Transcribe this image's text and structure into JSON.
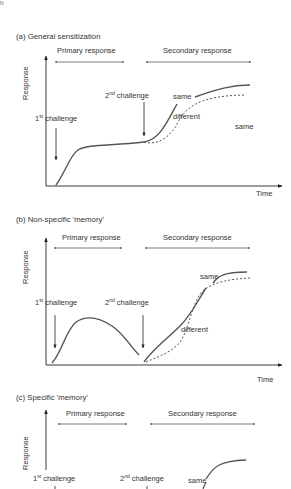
{
  "corner_mark": "N",
  "panels": [
    {
      "title": "(a) General sensitization",
      "primary_label": "Primary response",
      "secondary_label": "Secondary response",
      "y_axis": "Response",
      "x_axis": "Time",
      "first_challenge": {
        "num": "1",
        "sup": "st",
        "text": " challenge"
      },
      "second_challenge": {
        "num": "2",
        "sup": "nd",
        "text": " challenge"
      },
      "labels": {
        "same": "same",
        "different": "different",
        "same_right": "same"
      }
    },
    {
      "title": "(b) Non-specific 'memory'",
      "primary_label": "Primary response",
      "secondary_label": "Secondary response",
      "y_axis": "Response",
      "x_axis": "Time",
      "first_challenge": {
        "num": "1",
        "sup": "st",
        "text": " challenge"
      },
      "second_challenge": {
        "num": "2",
        "sup": "nd",
        "text": " challenge"
      },
      "labels": {
        "same": "same",
        "different": "different"
      }
    },
    {
      "title": "(c) Specific 'memory'",
      "primary_label": "Primary response",
      "secondary_label": "Secondary response",
      "y_axis": "Response",
      "first_challenge": {
        "num": "1",
        "sup": "st",
        "text": " challenge"
      },
      "second_challenge": {
        "num": "2",
        "sup": "nd",
        "text": " challenge"
      },
      "labels": {
        "same": "same"
      }
    }
  ],
  "colors": {
    "line": "#555555",
    "text": "#333333",
    "arrow": "#222222"
  }
}
